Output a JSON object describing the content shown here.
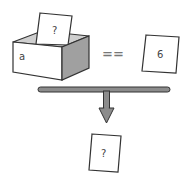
{
  "diagram": {
    "variable_box": {
      "name_label": "a",
      "card_label": "?"
    },
    "operator": "==",
    "compare_card": {
      "label": "6"
    },
    "result_card": {
      "label": "?"
    }
  },
  "colors": {
    "outline": "#333333",
    "box_side": "#9a9a9a",
    "box_inner": "#c8c8c8",
    "bar_fill": "#8c8c8c",
    "paper": "#ffffff"
  }
}
